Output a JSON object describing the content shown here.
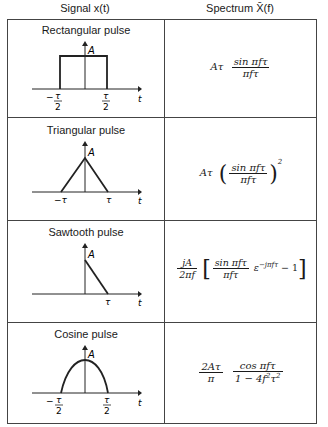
{
  "header": {
    "signal_col": "Signal x(t)",
    "spectrum_col": "Spectrum X̄(f)"
  },
  "rows": [
    {
      "title": "Rectangular pulse",
      "graph": {
        "type": "rectangular",
        "amplitude_label": "A",
        "axis_label": "t",
        "tick_left": "−τ/2",
        "tick_right": "τ/2"
      },
      "formula": "Aτ · sin πfτ / πfτ"
    },
    {
      "title": "Triangular pulse",
      "graph": {
        "type": "triangular",
        "amplitude_label": "A",
        "axis_label": "t",
        "tick_left": "−τ",
        "tick_right": "τ"
      },
      "formula": "Aτ · (sin πfτ / πfτ)^2"
    },
    {
      "title": "Sawtooth pulse",
      "graph": {
        "type": "sawtooth",
        "amplitude_label": "A",
        "axis_label": "t",
        "tick_right": "τ"
      },
      "formula": "jA/(2πf) · [ (sin πfτ / πfτ) · ε^(−jπfτ) − 1 ]"
    },
    {
      "title": "Cosine pulse",
      "graph": {
        "type": "cosine",
        "amplitude_label": "A",
        "axis_label": "t",
        "tick_left": "−τ/2",
        "tick_right": "τ/2"
      },
      "formula": "(2Aτ/π) · cos πfτ / (1 − 4f²τ²)"
    }
  ],
  "labels": {
    "A": "A",
    "t": "t",
    "tau": "τ",
    "two": "2",
    "minus": "−",
    "sin_pft": "sin πfτ",
    "pft": "πfτ",
    "Atau": "Aτ",
    "jA": "jA",
    "two_pf": "2πf",
    "exp": "ε",
    "exp_power": "−jπfτ",
    "minus_one": "− 1",
    "twoAtau": "2Aτ",
    "pi": "π",
    "cos_pft": "cos πfτ",
    "one_minus": "1 − 4f",
    "sq": "2",
    "tau_sq": "τ"
  }
}
